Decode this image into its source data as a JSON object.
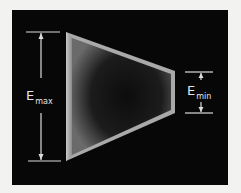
{
  "diagram": {
    "background": "#f2f2f0",
    "panel_color": "#070707",
    "shape": {
      "type": "tapered-trapezoid",
      "edge_color": "#bdbdbd",
      "fill_center": "#1a1a1a"
    },
    "labels": {
      "left": {
        "main": "E",
        "sub": "max"
      },
      "right": {
        "main": "E",
        "sub": "min"
      }
    },
    "line_color": "#dcdcdc"
  }
}
